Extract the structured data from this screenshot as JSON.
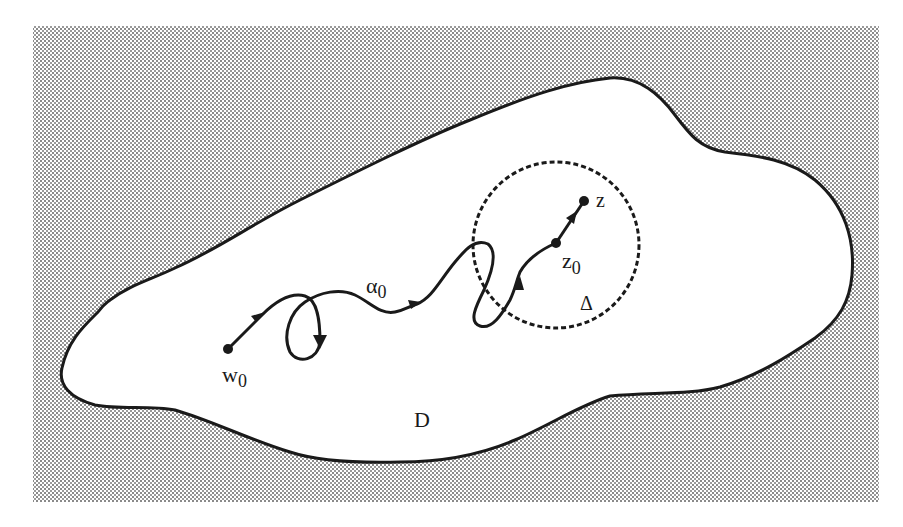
{
  "figure": {
    "colors": {
      "background": "#ffffff",
      "stipple_dot": "#8a8a8a",
      "ink": "#1a1a1a"
    },
    "region": {
      "label": "D"
    },
    "disk": {
      "label": "Δ",
      "style": "dashed-circle"
    },
    "path": {
      "label_main": "α",
      "label_sub": "0",
      "arrow_count": 6
    },
    "points": {
      "start": {
        "label_main": "w",
        "label_sub": "0"
      },
      "inner": {
        "label_main": "z",
        "label_sub": "0"
      },
      "end": {
        "label_main": "z"
      }
    }
  }
}
